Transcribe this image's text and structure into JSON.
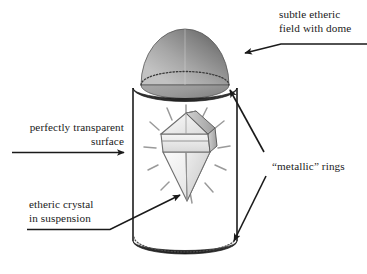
{
  "diagram": {
    "type": "line-drawing",
    "colors": {
      "ink": "#1a1a1a",
      "ring_dark": "#2b2b2b",
      "dome_light": "#b9b9b9",
      "dome_dark": "#6d6d6d",
      "crystal_light": "#f2f2f2",
      "crystal_shade": "#c9c9c9",
      "background": "#ffffff"
    },
    "annotations": [
      {
        "id": "dome-label",
        "lines": [
          "subtle etheric",
          "field with dome"
        ],
        "align": "left",
        "target": "dome"
      },
      {
        "id": "surface-label",
        "lines": [
          "perfectly transparent",
          "surface"
        ],
        "align": "right",
        "target": "cylinder-wall"
      },
      {
        "id": "crystal-label",
        "lines": [
          "etheric crystal",
          "in suspension"
        ],
        "align": "left",
        "target": "crystal"
      },
      {
        "id": "rings-label",
        "lines": [
          "“metallic” rings"
        ],
        "align": "left",
        "target": "top-ring and bottom-ring"
      }
    ],
    "parts": [
      "dome",
      "top-metallic-ring",
      "cylinder-body",
      "bottom-metallic-ring",
      "etheric-crystal",
      "radiance-rays"
    ]
  }
}
